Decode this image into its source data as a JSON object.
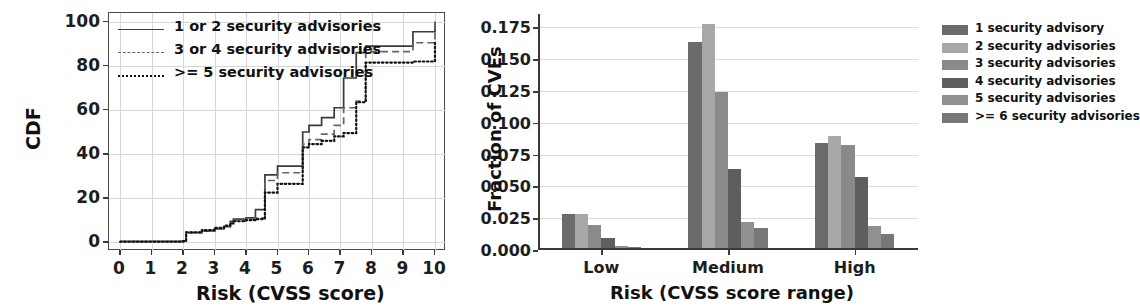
{
  "chart_data": [
    {
      "type": "line",
      "panel": "left",
      "title": "",
      "xlabel": "Risk (CVSS score)",
      "ylabel": "CDF",
      "xlim": [
        -0.35,
        10.35
      ],
      "ylim": [
        -4,
        104
      ],
      "xticks": [
        "0",
        "1",
        "2",
        "3",
        "4",
        "5",
        "6",
        "7",
        "8",
        "9",
        "10"
      ],
      "yticks": [
        "0",
        "20",
        "40",
        "60",
        "80",
        "100"
      ],
      "grid": true,
      "legend_position": "upper left",
      "series": [
        {
          "name": "1 or 2 security advisories",
          "style": "solid",
          "color": "#3b3b3b",
          "x": [
            0.0,
            2.0,
            2.1,
            2.6,
            3.0,
            3.3,
            3.5,
            3.6,
            4.0,
            4.3,
            4.6,
            5.0,
            5.8,
            6.0,
            6.4,
            6.8,
            7.1,
            7.5,
            7.8,
            9.3,
            10.0
          ],
          "y": [
            0.4,
            0.6,
            4.3,
            5.0,
            6.0,
            7.0,
            9.5,
            10.5,
            11.0,
            14.8,
            30.5,
            34.5,
            50.0,
            53.0,
            56.5,
            61.0,
            74.5,
            86.0,
            89.0,
            95.5,
            100.0
          ]
        },
        {
          "name": "3 or 4 security advisories",
          "style": "dashed",
          "color": "#666666",
          "x": [
            0.0,
            2.0,
            2.1,
            2.6,
            3.0,
            3.3,
            3.5,
            3.6,
            4.0,
            4.3,
            4.6,
            5.0,
            5.8,
            6.0,
            6.4,
            6.8,
            7.1,
            7.5,
            7.8,
            9.3,
            10.0
          ],
          "y": [
            0.3,
            0.5,
            4.2,
            5.0,
            6.2,
            7.2,
            9.0,
            10.0,
            10.5,
            11.0,
            28.0,
            31.5,
            44.5,
            46.5,
            49.0,
            53.0,
            61.0,
            64.0,
            86.5,
            90.5,
            100.0
          ]
        },
        {
          "name": ">= 5 security advisories",
          "style": "dotted",
          "color": "#111111",
          "x": [
            0.0,
            2.0,
            2.1,
            2.6,
            3.0,
            3.3,
            3.5,
            3.6,
            4.0,
            4.3,
            4.6,
            5.0,
            5.8,
            6.0,
            6.4,
            6.8,
            7.1,
            7.5,
            7.8,
            9.3,
            10.0
          ],
          "y": [
            0.2,
            0.4,
            4.5,
            5.5,
            6.5,
            7.5,
            8.5,
            9.5,
            10.0,
            10.5,
            22.5,
            26.5,
            43.0,
            44.5,
            46.0,
            48.0,
            49.5,
            63.5,
            81.5,
            82.0,
            90.5
          ]
        }
      ]
    },
    {
      "type": "bar",
      "panel": "right",
      "title": "",
      "xlabel": "Risk (CVSS score range)",
      "ylabel": "Fraction of CVEs",
      "categories": [
        "Low",
        "Medium",
        "High"
      ],
      "yticks": [
        "0.000",
        "0.025",
        "0.050",
        "0.075",
        "0.100",
        "0.125",
        "0.150",
        "0.175"
      ],
      "ylim": [
        0.0,
        0.1855
      ],
      "grid": true,
      "legend_position": "upper right",
      "series": [
        {
          "name": "1 security advisory",
          "color": "#6b6b6b",
          "values": [
            0.0285,
            0.1635,
            0.0845
          ]
        },
        {
          "name": "2 security advisories",
          "color": "#a8a8a8",
          "values": [
            0.028,
            0.178,
            0.09
          ]
        },
        {
          "name": "3 security advisories",
          "color": "#8a8a8a",
          "values": [
            0.02,
            0.124,
            0.0825
          ]
        },
        {
          "name": "4 security advisories",
          "color": "#5e5e5e",
          "values": [
            0.0098,
            0.0635,
            0.057
          ]
        },
        {
          "name": "5 security advisories",
          "color": "#909090",
          "values": [
            0.003,
            0.0218,
            0.0188
          ]
        },
        {
          "name": ">= 6 security advisories",
          "color": "#777777",
          "values": [
            0.0022,
            0.0172,
            0.0128
          ]
        }
      ]
    }
  ]
}
